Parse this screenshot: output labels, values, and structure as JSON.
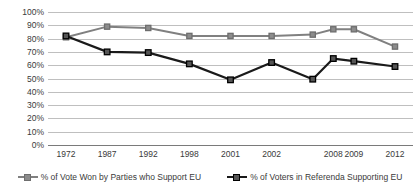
{
  "chart_data": {
    "type": "line",
    "title": "",
    "xlabel": "",
    "ylabel": "",
    "ylim": [
      0,
      100
    ],
    "ytick_labels": [
      "100%",
      "90%",
      "80%",
      "70%",
      "60%",
      "50%",
      "40%",
      "30%",
      "20%",
      "10%",
      "0%"
    ],
    "ytick_values": [
      100,
      90,
      80,
      70,
      60,
      50,
      40,
      30,
      20,
      10,
      0
    ],
    "grid": true,
    "legend_position": "bottom",
    "categories": [
      "1972",
      "1987",
      "1992",
      "1998",
      "2001",
      "2002",
      "2008",
      "2009",
      "2012"
    ],
    "x_positions": [
      0,
      1,
      2,
      3,
      4,
      5,
      6.5,
      7,
      8
    ],
    "series": [
      {
        "name": "% of Vote Won by Parties who Support EU",
        "color": "#808080",
        "marker": "square",
        "x": [
          0,
          1,
          2,
          3,
          4,
          5,
          6,
          6.5,
          7,
          8
        ],
        "values": [
          81,
          89,
          88,
          82,
          82,
          82,
          83,
          87,
          87,
          74
        ]
      },
      {
        "name": "% of Voters in Referenda Supporting EU",
        "color": "#1a1a1a",
        "marker": "square",
        "x": [
          0,
          1,
          2,
          3,
          4,
          5,
          6,
          6.5,
          7,
          8
        ],
        "values": [
          82,
          70,
          69.5,
          61,
          49,
          62,
          49.5,
          65,
          63,
          59
        ]
      }
    ]
  },
  "legend": {
    "items": [
      {
        "label": "% of Vote Won by Parties who Support EU",
        "color": "#808080"
      },
      {
        "label": "% of Voters in Referenda Supporting EU",
        "color": "#1a1a1a"
      }
    ]
  },
  "colors": {
    "gridline": "#bfbfbf",
    "axis": "#7a7a7a",
    "text": "#3a3a3a",
    "background": "#ffffff",
    "series_support": "#808080",
    "series_referenda": "#1a1a1a"
  }
}
